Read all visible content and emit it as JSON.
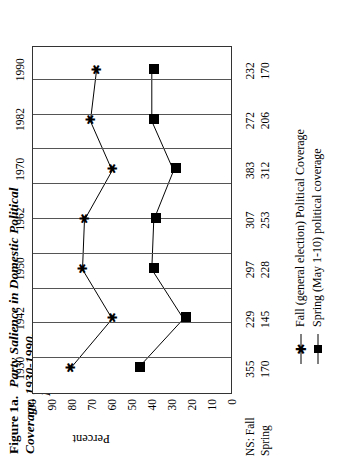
{
  "figure": {
    "label": "Figure 1a.",
    "title_line1": "Party Salience in Domestic Political Coverage, 1930-1990,",
    "title_line2": "New York Times"
  },
  "chart_data": {
    "type": "line",
    "title": "Party Salience in Domestic Political Coverage, 1930-1990, New York Times",
    "xlabel": "",
    "ylabel": "Percent",
    "ylim": [
      0,
      100
    ],
    "yticks": [
      "100",
      "90",
      "80",
      "70",
      "60",
      "50",
      "40",
      "30",
      "20",
      "10",
      "0"
    ],
    "grid": "vertical",
    "legend_position": "below",
    "categories": [
      "1930",
      "1942",
      "1950",
      "1962",
      "1970",
      "1982",
      "1990"
    ],
    "series": [
      {
        "name": "Fall (general election) Political Coverage",
        "marker": "star",
        "values": [
          81,
          60,
          75,
          74,
          60,
          71,
          68
        ]
      },
      {
        "name": "Spring (May 1-10) political coverage",
        "marker": "filled-square",
        "values": [
          47,
          24,
          40,
          39,
          29,
          40,
          40
        ]
      }
    ],
    "ns_table": {
      "header": "NS: Fall",
      "rows": [
        {
          "label": "NS: Fall",
          "values": [
            "355",
            "229",
            "297",
            "307",
            "383",
            "272",
            "232"
          ]
        },
        {
          "label": "Spring",
          "values": [
            "170",
            "145",
            "228",
            "253",
            "312",
            "206",
            "170"
          ]
        }
      ]
    }
  },
  "legend": {
    "items": [
      {
        "key": "star-marker",
        "text": "Fall (general election) Political Coverage"
      },
      {
        "key": "square-marker",
        "text": "Spring (May 1-10) political coverage"
      }
    ]
  },
  "colors": {
    "ink": "#000000",
    "grid": "#555555",
    "axis": "#333333"
  }
}
